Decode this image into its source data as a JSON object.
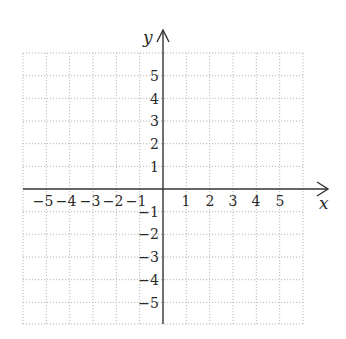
{
  "diagram": {
    "type": "coordinate-plane",
    "x_axis": {
      "label": "x",
      "range": [
        -6,
        6
      ],
      "tick_labels": [
        "-5",
        "-4",
        "-3",
        "-2",
        "-1",
        "1",
        "2",
        "3",
        "4",
        "5"
      ]
    },
    "y_axis": {
      "label": "y",
      "range": [
        -6,
        6
      ],
      "tick_labels": [
        "5",
        "4",
        "3",
        "2",
        "1",
        "-1",
        "-2",
        "-3",
        "-4",
        "-5"
      ]
    },
    "grid": {
      "style": "dotted",
      "cells_x": 12,
      "cells_y": 12,
      "color": "#b8b8b8"
    },
    "axis_color": "#333333"
  },
  "labels": {
    "x": "x",
    "y": "y",
    "xticks": {
      "n5": "−5",
      "n4": "−4",
      "n3": "−3",
      "n2": "−2",
      "n1": "−1",
      "p1": "1",
      "p2": "2",
      "p3": "3",
      "p4": "4",
      "p5": "5"
    },
    "yticks": {
      "p5": "5",
      "p4": "4",
      "p3": "3",
      "p2": "2",
      "p1": "1",
      "n1": "−1",
      "n2": "−2",
      "n3": "−3",
      "n4": "−4",
      "n5": "−5"
    }
  }
}
